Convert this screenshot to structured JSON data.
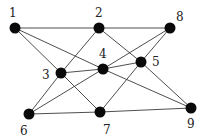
{
  "diagram": {
    "type": "undirected-graph",
    "nodes": [
      {
        "id": "1",
        "label": "1",
        "x": 15,
        "y": 28,
        "lx": 9,
        "ly": 17
      },
      {
        "id": "2",
        "label": "2",
        "x": 99,
        "y": 28,
        "lx": 95,
        "ly": 17
      },
      {
        "id": "8",
        "label": "8",
        "x": 170,
        "y": 28,
        "lx": 176,
        "ly": 21
      },
      {
        "id": "3",
        "label": "3",
        "x": 61,
        "y": 73,
        "lx": 42,
        "ly": 79
      },
      {
        "id": "4",
        "label": "4",
        "x": 103,
        "y": 69,
        "lx": 99,
        "ly": 58
      },
      {
        "id": "5",
        "label": "5",
        "x": 141,
        "y": 62,
        "lx": 152,
        "ly": 66
      },
      {
        "id": "6",
        "label": "6",
        "x": 29,
        "y": 114,
        "lx": 20,
        "ly": 135
      },
      {
        "id": "7",
        "label": "7",
        "x": 100,
        "y": 112,
        "lx": 103,
        "ly": 134
      },
      {
        "id": "9",
        "label": "9",
        "x": 191,
        "y": 108,
        "lx": 187,
        "ly": 128
      }
    ],
    "edges": [
      [
        "1",
        "2"
      ],
      [
        "1",
        "3"
      ],
      [
        "1",
        "4"
      ],
      [
        "2",
        "3"
      ],
      [
        "2",
        "5"
      ],
      [
        "2",
        "8"
      ],
      [
        "3",
        "4"
      ],
      [
        "3",
        "6"
      ],
      [
        "3",
        "7"
      ],
      [
        "4",
        "5"
      ],
      [
        "4",
        "6"
      ],
      [
        "4",
        "8"
      ],
      [
        "4",
        "9"
      ],
      [
        "5",
        "7"
      ],
      [
        "5",
        "8"
      ],
      [
        "5",
        "9"
      ],
      [
        "6",
        "7"
      ],
      [
        "7",
        "9"
      ]
    ],
    "node_radius": 5.5,
    "colors": {
      "node": "#0a0a0a",
      "edge": "#3a3a3a",
      "label": "#222222",
      "background": "#ffffff"
    }
  }
}
